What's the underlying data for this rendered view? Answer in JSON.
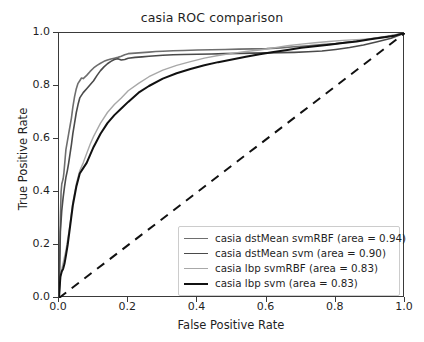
{
  "chart_data": {
    "type": "line",
    "title": "casia ROC comparison",
    "xlabel": "False Positive Rate",
    "ylabel": "True Positive Rate",
    "xlim": [
      0.0,
      1.0
    ],
    "ylim": [
      0.0,
      1.0
    ],
    "xticks": [
      "0.0",
      "0.2",
      "0.4",
      "0.6",
      "0.8",
      "1.0"
    ],
    "yticks": [
      "0.0",
      "0.2",
      "0.4",
      "0.6",
      "0.8",
      "1.0"
    ],
    "xtick_values": [
      0.0,
      0.2,
      0.4,
      0.6,
      0.8,
      1.0
    ],
    "ytick_values": [
      0.0,
      0.2,
      0.4,
      0.6,
      0.8,
      1.0
    ],
    "grid": false,
    "legend_position": "lower right",
    "series": [
      {
        "name": "casia dstMean svmRBF (area = 0.94)",
        "label": "casia dstMean svmRBF (area = 0.94)",
        "area": 0.94,
        "color": "#6e6e6e",
        "width": 1.6,
        "dash": "none",
        "x": [
          0.0,
          0.004,
          0.006,
          0.008,
          0.01,
          0.012,
          0.014,
          0.016,
          0.018,
          0.02,
          0.024,
          0.028,
          0.032,
          0.036,
          0.04,
          0.045,
          0.05,
          0.055,
          0.06,
          0.065,
          0.07,
          0.08,
          0.09,
          0.1,
          0.11,
          0.12,
          0.13,
          0.14,
          0.15,
          0.16,
          0.17,
          0.18,
          0.19,
          0.2,
          0.22,
          0.24,
          0.26,
          0.28,
          0.3,
          0.33,
          0.36,
          0.4,
          0.44,
          0.48,
          0.52,
          0.56,
          0.6,
          0.64,
          0.68,
          0.72,
          0.76,
          0.8,
          0.85,
          0.9,
          0.95,
          1.0
        ],
        "y": [
          0.0,
          0.3,
          0.4,
          0.43,
          0.44,
          0.45,
          0.47,
          0.5,
          0.53,
          0.56,
          0.59,
          0.62,
          0.65,
          0.68,
          0.72,
          0.76,
          0.79,
          0.81,
          0.82,
          0.83,
          0.828,
          0.84,
          0.855,
          0.868,
          0.878,
          0.886,
          0.893,
          0.898,
          0.902,
          0.905,
          0.908,
          0.912,
          0.918,
          0.922,
          0.924,
          0.926,
          0.928,
          0.93,
          0.931,
          0.933,
          0.934,
          0.936,
          0.937,
          0.938,
          0.939,
          0.94,
          0.941,
          0.944,
          0.948,
          0.952,
          0.956,
          0.96,
          0.968,
          0.978,
          0.988,
          1.0
        ]
      },
      {
        "name": "casia dstMean svm (area = 0.90)",
        "label": "casia dstMean svm (area = 0.90)",
        "area": 0.9,
        "color": "#4a4a4a",
        "width": 1.6,
        "dash": "none",
        "x": [
          0.0,
          0.004,
          0.008,
          0.012,
          0.016,
          0.02,
          0.024,
          0.028,
          0.032,
          0.036,
          0.04,
          0.045,
          0.05,
          0.055,
          0.06,
          0.07,
          0.08,
          0.09,
          0.1,
          0.11,
          0.12,
          0.13,
          0.14,
          0.15,
          0.16,
          0.17,
          0.18,
          0.19,
          0.2,
          0.22,
          0.24,
          0.26,
          0.28,
          0.3,
          0.33,
          0.36,
          0.4,
          0.44,
          0.48,
          0.52,
          0.56,
          0.6,
          0.64,
          0.68,
          0.72,
          0.76,
          0.8,
          0.84,
          0.88,
          0.92,
          0.96,
          1.0
        ],
        "y": [
          0.0,
          0.25,
          0.33,
          0.38,
          0.42,
          0.455,
          0.48,
          0.51,
          0.545,
          0.58,
          0.62,
          0.66,
          0.7,
          0.73,
          0.755,
          0.775,
          0.79,
          0.805,
          0.82,
          0.84,
          0.858,
          0.872,
          0.884,
          0.893,
          0.9,
          0.903,
          0.898,
          0.9,
          0.905,
          0.908,
          0.91,
          0.912,
          0.914,
          0.916,
          0.918,
          0.919,
          0.92,
          0.921,
          0.922,
          0.923,
          0.924,
          0.925,
          0.926,
          0.927,
          0.929,
          0.932,
          0.938,
          0.945,
          0.955,
          0.967,
          0.98,
          1.0
        ]
      },
      {
        "name": "casia lbp svmRBF (area = 0.83)",
        "label": "casia lbp svmRBF (area = 0.83)",
        "area": 0.83,
        "color": "#a8a8a8",
        "width": 1.4,
        "dash": "none",
        "x": [
          0.0,
          0.005,
          0.01,
          0.015,
          0.02,
          0.025,
          0.03,
          0.035,
          0.04,
          0.05,
          0.06,
          0.07,
          0.08,
          0.09,
          0.1,
          0.12,
          0.14,
          0.16,
          0.18,
          0.2,
          0.23,
          0.26,
          0.3,
          0.34,
          0.38,
          0.42,
          0.46,
          0.5,
          0.54,
          0.58,
          0.62,
          0.66,
          0.7,
          0.74,
          0.78,
          0.82,
          0.86,
          0.9,
          0.94,
          0.97,
          1.0
        ],
        "y": [
          0.0,
          0.09,
          0.12,
          0.15,
          0.18,
          0.22,
          0.26,
          0.31,
          0.36,
          0.43,
          0.48,
          0.51,
          0.545,
          0.58,
          0.61,
          0.66,
          0.7,
          0.73,
          0.755,
          0.782,
          0.81,
          0.835,
          0.86,
          0.878,
          0.892,
          0.905,
          0.915,
          0.923,
          0.93,
          0.936,
          0.944,
          0.952,
          0.958,
          0.963,
          0.968,
          0.972,
          0.975,
          0.978,
          0.984,
          0.992,
          1.0
        ]
      },
      {
        "name": "casia lbp svm (area = 0.83)",
        "label": "casia lbp svm (area = 0.83)",
        "area": 0.83,
        "color": "#111111",
        "width": 2.0,
        "dash": "none",
        "x": [
          0.0,
          0.004,
          0.008,
          0.012,
          0.016,
          0.02,
          0.025,
          0.03,
          0.035,
          0.04,
          0.05,
          0.06,
          0.07,
          0.08,
          0.09,
          0.1,
          0.12,
          0.14,
          0.16,
          0.18,
          0.2,
          0.23,
          0.26,
          0.3,
          0.34,
          0.38,
          0.42,
          0.46,
          0.5,
          0.54,
          0.58,
          0.62,
          0.66,
          0.7,
          0.74,
          0.78,
          0.82,
          0.86,
          0.9,
          0.94,
          0.97,
          1.0
        ],
        "y": [
          0.0,
          0.08,
          0.1,
          0.11,
          0.13,
          0.16,
          0.2,
          0.25,
          0.3,
          0.35,
          0.42,
          0.47,
          0.49,
          0.51,
          0.54,
          0.57,
          0.62,
          0.66,
          0.69,
          0.715,
          0.74,
          0.775,
          0.8,
          0.828,
          0.848,
          0.864,
          0.878,
          0.89,
          0.9,
          0.91,
          0.92,
          0.928,
          0.936,
          0.944,
          0.95,
          0.956,
          0.962,
          0.968,
          0.976,
          0.984,
          0.99,
          1.0
        ]
      }
    ],
    "reference_line": {
      "name": "chance-diagonal",
      "x": [
        0.0,
        1.0
      ],
      "y": [
        0.0,
        1.0
      ],
      "color": "#111111",
      "width": 2.0,
      "dash": "9,7"
    }
  }
}
